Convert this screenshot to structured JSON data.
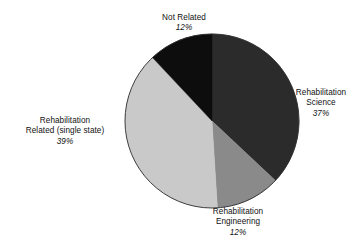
{
  "chart_data": {
    "type": "pie",
    "title": "",
    "subtitle": "",
    "xlabel": "",
    "ylabel": "",
    "legend_position": "none",
    "grid": false,
    "value_unit": "percent",
    "start_angle_deg": 0,
    "direction": "clockwise",
    "categories": [
      "Rehabilitation Science",
      "Rehabilitation Engineering",
      "Rehabilitation Related (single state)",
      "Not Related"
    ],
    "values": [
      37,
      12,
      39,
      12
    ],
    "slices": [
      {
        "label": "Rehabilitation Science",
        "label_line1": "Rehabilitation",
        "label_line2": "Science",
        "value": 37,
        "value_text": "37%",
        "color": "#2b2b2b",
        "start_angle_deg": 0,
        "end_angle_deg": 133.2
      },
      {
        "label": "Rehabilitation Engineering",
        "label_line1": "Rehabilitation",
        "label_line2": "Engineering",
        "value": 12,
        "value_text": "12%",
        "color": "#8a8a8a",
        "start_angle_deg": 133.2,
        "end_angle_deg": 176.4
      },
      {
        "label": "Rehabilitation Related (single state)",
        "label_line1": "Rehabilitation",
        "label_line2": "Related (single state)",
        "value": 39,
        "value_text": "39%",
        "color": "#c9c9c9",
        "start_angle_deg": 176.4,
        "end_angle_deg": 316.8
      },
      {
        "label": "Not Related",
        "label_line1": "Not Related",
        "label_line2": "",
        "value": 12,
        "value_text": "12%",
        "color": "#0d0d0d",
        "start_angle_deg": 316.8,
        "end_angle_deg": 360
      }
    ],
    "geometry": {
      "center_x": 212,
      "center_y": 121,
      "radius": 87
    },
    "colors": {
      "background": "#ffffff",
      "outline": "#2f2f2f",
      "text": "#121212"
    }
  }
}
